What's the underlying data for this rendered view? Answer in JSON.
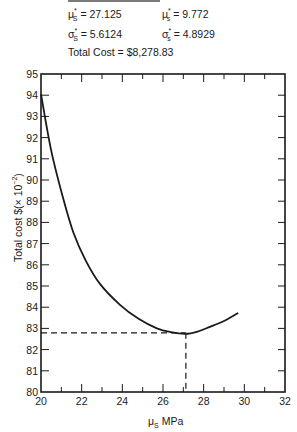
{
  "header": {
    "params": [
      {
        "symbol": "μ",
        "sub": "S",
        "sup": "*",
        "value": "27.125",
        "label": "= 27.125"
      },
      {
        "symbol": "μ",
        "sub": "s",
        "sup": "*",
        "value": "9.772",
        "label": "= 9.772"
      },
      {
        "symbol": "σ",
        "sub": "S",
        "sup": "*",
        "value": "5.6124",
        "label": "= 5.6124"
      },
      {
        "symbol": "σ",
        "sub": "s",
        "sup": "*",
        "value": "4.8929",
        "label": "= 4.8929"
      }
    ],
    "total_cost": "Total Cost = $8,278.83"
  },
  "axes": {
    "ylabel_main": "Total cost $(× 10",
    "ylabel_exp": "−2",
    "ylabel_close": ")",
    "xlabel_symbol": "μ",
    "xlabel_sub": "S",
    "xlabel_unit": " MPa"
  },
  "chart_data": {
    "type": "line",
    "title": "",
    "xlabel": "μS MPa",
    "ylabel": "Total cost $(× 10^-2)",
    "xlim": [
      20,
      32
    ],
    "ylim": [
      80,
      95
    ],
    "x_ticks": [
      20,
      22,
      24,
      26,
      28,
      30,
      32
    ],
    "y_ticks": [
      80,
      81,
      82,
      83,
      84,
      85,
      86,
      87,
      88,
      89,
      90,
      91,
      92,
      93,
      94,
      95
    ],
    "grid": false,
    "series": [
      {
        "name": "Total cost",
        "x": [
          20.0,
          20.5,
          21.1,
          21.6,
          22.2,
          22.9,
          23.9,
          24.8,
          25.7,
          26.4,
          27.1,
          27.7,
          28.3,
          29.0,
          29.7
        ],
        "y": [
          94.05,
          91.4,
          89.1,
          87.5,
          86.2,
          85.1,
          84.1,
          83.45,
          83.0,
          82.82,
          82.74,
          82.85,
          83.07,
          83.35,
          83.73
        ]
      }
    ],
    "annotations": {
      "optimum_x": 27.125,
      "optimum_y": 82.79,
      "dashed_guides": true,
      "text": [
        "μ*S = 27.125",
        "μ*s = 9.772",
        "σ*S = 5.6124",
        "σ*s = 4.8929",
        "Total Cost = $8,278.83"
      ]
    }
  }
}
